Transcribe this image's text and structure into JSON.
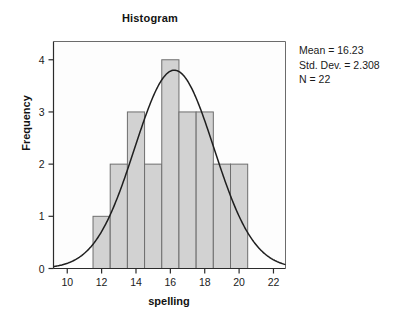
{
  "chart_data": {
    "type": "bar",
    "title": "Histogram",
    "xlabel": "spelling",
    "ylabel": "Frequency",
    "xlim": [
      9.2,
      22.7
    ],
    "ylim": [
      0,
      4.35
    ],
    "xticks": [
      10,
      12,
      14,
      16,
      18,
      20,
      22
    ],
    "yticks": [
      0,
      1,
      2,
      3,
      4
    ],
    "grid": false,
    "legend": "none",
    "bin_width": 1,
    "bin_edges": [
      11.5,
      12.5,
      13.5,
      14.5,
      15.5,
      16.5,
      17.5,
      18.5,
      19.5,
      20.5
    ],
    "categories": [
      "11.5-12.5",
      "12.5-13.5",
      "13.5-14.5",
      "14.5-15.5",
      "15.5-16.5",
      "16.5-17.5",
      "17.5-18.5",
      "18.5-19.5",
      "19.5-20.5"
    ],
    "bin_centers": [
      12,
      13,
      14,
      15,
      16,
      17,
      18,
      19,
      20
    ],
    "values": [
      1,
      2,
      3,
      2,
      4,
      3,
      3,
      2,
      2
    ],
    "overlay": {
      "type": "line",
      "name": "normal curve",
      "mean": 16.23,
      "std_dev": 2.308,
      "n": 22,
      "peak_value": 3.8
    },
    "bar_fill_color": "#d2d2d2",
    "bar_border_color": "#6e6e6e",
    "curve_color": "#1f1f1f",
    "axis_color": "#6b6b6b"
  },
  "annotations": {
    "mean_label": "Mean = 16.23",
    "std_dev_label": "Std. Dev. = 2.308",
    "n_label": "N = 22"
  },
  "axis_tick_labels": {
    "x": [
      "10",
      "12",
      "14",
      "16",
      "18",
      "20",
      "22"
    ],
    "y": [
      "0",
      "1",
      "2",
      "3",
      "4"
    ]
  }
}
